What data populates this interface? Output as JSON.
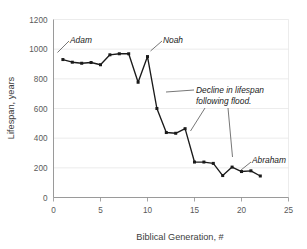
{
  "chart_data": {
    "type": "line",
    "title": "",
    "xlabel": "Biblical Generation, #",
    "ylabel": "Lifespan, years",
    "xlim": [
      0,
      25
    ],
    "ylim": [
      0,
      1200
    ],
    "xticks": [
      0,
      5,
      10,
      15,
      20,
      25
    ],
    "yticks": [
      0,
      200,
      400,
      600,
      800,
      1000,
      1200
    ],
    "grid": "horizontal",
    "legend": "none",
    "marker": "square",
    "x": [
      1,
      2,
      3,
      4,
      5,
      6,
      7,
      8,
      9,
      10,
      11,
      12,
      13,
      14,
      15,
      16,
      17,
      18,
      19,
      20,
      21,
      22
    ],
    "values": [
      930,
      912,
      905,
      910,
      895,
      962,
      969,
      969,
      777,
      950,
      600,
      438,
      433,
      464,
      239,
      239,
      230,
      148,
      205,
      175,
      180,
      145
    ],
    "series": [
      {
        "name": "Lifespan",
        "values": [
          930,
          912,
          905,
          910,
          895,
          962,
          969,
          969,
          777,
          950,
          600,
          438,
          433,
          464,
          239,
          239,
          230,
          148,
          205,
          175,
          180,
          145
        ]
      }
    ],
    "annotations": [
      {
        "id": "adam",
        "text": "Adam",
        "point_x": 1,
        "point_y": 930
      },
      {
        "id": "noah",
        "text": "Noah",
        "point_x": 10,
        "point_y": 950
      },
      {
        "id": "decline",
        "text": "Decline in lifespan",
        "text_line2": "following flood.",
        "point_x": 15.5,
        "point_y": 460
      },
      {
        "id": "abraham",
        "text": "Abraham",
        "point_x": 20,
        "point_y": 175
      }
    ]
  },
  "annotation_text": {
    "adam": "Adam",
    "noah": "Noah",
    "decline_line1": "Decline in lifespan",
    "decline_line2": "following flood.",
    "abraham": "Abraham"
  },
  "axis": {
    "x_title": "Biblical Generation, #",
    "y_title": "Lifespan, years",
    "xticks": [
      "0",
      "5",
      "10",
      "15",
      "20",
      "25"
    ],
    "yticks": [
      "0",
      "200",
      "400",
      "600",
      "800",
      "1000",
      "1200"
    ]
  },
  "colors": {
    "series": "#1a1a1a",
    "grid": "#e4e4e4",
    "axis": "#8f8f8f",
    "text": "#5a5a5a",
    "background": "#ffffff"
  }
}
